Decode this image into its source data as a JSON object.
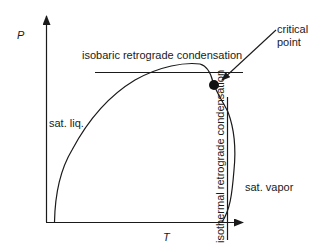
{
  "diagram": {
    "type": "pressure-temperature phase diagram (retrograde condensation)",
    "axes": {
      "y_label": "P",
      "x_label": "T"
    },
    "labels": {
      "isobaric": "isobaric retrograde condensation",
      "isothermal": "isothermal retrograde condensation",
      "critical_line1": "critical",
      "critical_line2": "point",
      "sat_liq": "sat. liq.",
      "sat_vapor": "sat. vapor"
    },
    "colors": {
      "line": "#1a1a1a",
      "background": "#ffffff"
    }
  }
}
